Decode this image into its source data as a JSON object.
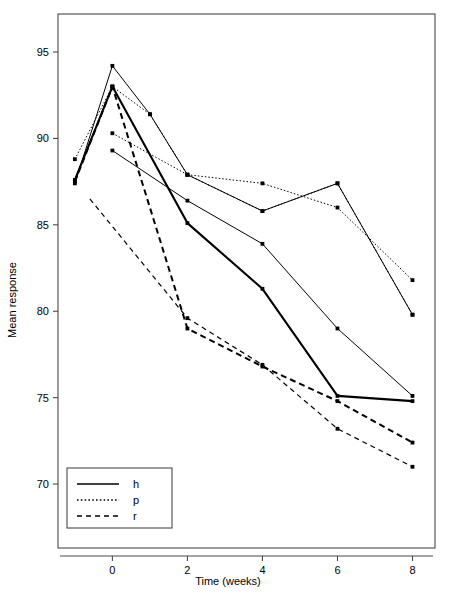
{
  "chart_data": {
    "type": "line",
    "title": "",
    "xlabel": "Time (weeks)",
    "ylabel": "Mean response",
    "xlim": [
      -1.45,
      8.6
    ],
    "ylim": [
      66.3,
      97.2
    ],
    "xticks": [
      0,
      2,
      4,
      6,
      8
    ],
    "yticks": [
      70,
      75,
      80,
      85,
      90,
      95
    ],
    "grid": false,
    "legend_position": "bottom-left",
    "legend": [
      {
        "label": "h",
        "style": "solid"
      },
      {
        "label": "p",
        "style": "dotted"
      },
      {
        "label": "r",
        "style": "dashed"
      }
    ],
    "markers": "filled-square",
    "color": "#000000",
    "series": [
      {
        "name": "h-1",
        "label": "h",
        "style": "solid",
        "width": 1.0,
        "x": [
          -1,
          0,
          1,
          2,
          4,
          6,
          8
        ],
        "y": [
          87.4,
          94.2,
          91.4,
          87.9,
          85.8,
          87.4,
          79.8
        ]
      },
      {
        "name": "h-2",
        "label": "h",
        "style": "solid",
        "width": 2.1,
        "x": [
          -1,
          0,
          2,
          4,
          6,
          8
        ],
        "y": [
          87.6,
          93.0,
          85.1,
          81.3,
          75.1,
          74.8
        ]
      },
      {
        "name": "p-1",
        "label": "p",
        "style": "dotted",
        "width": 1.0,
        "x": [
          -1,
          0,
          1,
          2,
          4,
          6,
          8
        ],
        "y": [
          88.8,
          93.0,
          91.4,
          87.9,
          87.4,
          86.0,
          81.8
        ]
      },
      {
        "name": "p-2",
        "label": "p",
        "style": "dotted",
        "width": 1.0,
        "x": [
          0,
          2,
          4,
          6,
          8
        ],
        "y": [
          90.3,
          87.9,
          85.8,
          87.4,
          79.8
        ]
      },
      {
        "name": "h-3",
        "label": "h",
        "style": "solid",
        "width": 1.0,
        "x": [
          0,
          2,
          4,
          6,
          8
        ],
        "y": [
          89.3,
          86.4,
          83.9,
          79.0,
          75.1
        ]
      },
      {
        "name": "r-1",
        "label": "r",
        "style": "dashed",
        "width": 2.0,
        "x": [
          -1,
          0,
          2,
          4,
          6,
          8
        ],
        "y": [
          87.5,
          93.0,
          79.0,
          76.8,
          74.8,
          72.4
        ]
      },
      {
        "name": "r-2",
        "label": "r",
        "style": "dashed",
        "width": 1.2,
        "x": [
          -0.6,
          2,
          4,
          6,
          8
        ],
        "y": [
          86.5,
          79.6,
          76.9,
          73.2,
          71.0
        ]
      }
    ]
  },
  "axis": {
    "y_tick_labels": [
      "95",
      "90",
      "85",
      "80",
      "75",
      "70"
    ],
    "x_tick_labels": [
      "0",
      "2",
      "4",
      "6",
      "8"
    ],
    "x_title": "Time (weeks)",
    "y_title": "Mean response"
  }
}
